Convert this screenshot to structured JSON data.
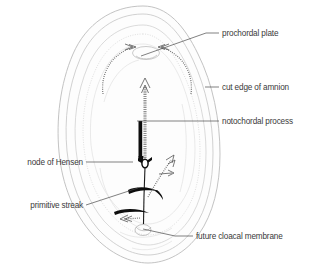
{
  "figure": {
    "background_color": "#ffffff",
    "text_color": "#3a3a3a",
    "leader_color": "#4a4a4a",
    "outline_color": "#bdbdbd",
    "accent_black": "#0d0d0d",
    "hatch_color": "#6f6f6f"
  },
  "labels": [
    {
      "id": "prochordal-plate",
      "text": "prochordal plate",
      "side": "right",
      "text_x": 222,
      "text_y": 36,
      "leader": "M 219 33 L 206 33 L 141 56"
    },
    {
      "id": "cut-edge-of-amnion",
      "text": "cut edge of amnion",
      "side": "right",
      "text_x": 222,
      "text_y": 90,
      "leader": "M 219 87 L 205 87"
    },
    {
      "id": "notochordal-process",
      "text": "notochordal process",
      "side": "right",
      "text_x": 222,
      "text_y": 124,
      "leader": "M 219 121 L 137 121"
    },
    {
      "id": "node-of-hensen",
      "text": "node of Hensen",
      "side": "left",
      "text_x": 83,
      "text_y": 165,
      "leader": "M 86 162 L 133 162"
    },
    {
      "id": "primitive-streak",
      "text": "primitive streak",
      "side": "left",
      "text_x": 83,
      "text_y": 208,
      "leader": "M 86 205 L 138 188"
    },
    {
      "id": "future-cloacal-membrane",
      "text": "future cloacal membrane",
      "side": "right",
      "text_x": 196,
      "text_y": 239,
      "leader": "M 193 236 L 175 236 L 143 229"
    }
  ],
  "structures": [
    {
      "id": "amnion-cut-edge",
      "name": "cut edge of amnion"
    },
    {
      "id": "embryonic-disc-outline",
      "name": "embryonic disc outline"
    },
    {
      "id": "prochordal-plate-oval",
      "name": "prochordal plate"
    },
    {
      "id": "notochordal-process-arrow",
      "name": "notochordal process"
    },
    {
      "id": "node-of-hensen-ring",
      "name": "node of Hensen"
    },
    {
      "id": "primitive-streak-line",
      "name": "primitive streak"
    },
    {
      "id": "future-cloacal-membrane-oval",
      "name": "future cloacal membrane"
    },
    {
      "id": "migration-arrow-left",
      "name": "cell migration arrow left"
    },
    {
      "id": "migration-arrow-right",
      "name": "cell migration arrow right"
    },
    {
      "id": "migration-arrow-diagonal",
      "name": "cell migration arrow diagonal"
    },
    {
      "id": "migration-arrow-lower-left",
      "name": "cell migration arrow lower left"
    }
  ]
}
